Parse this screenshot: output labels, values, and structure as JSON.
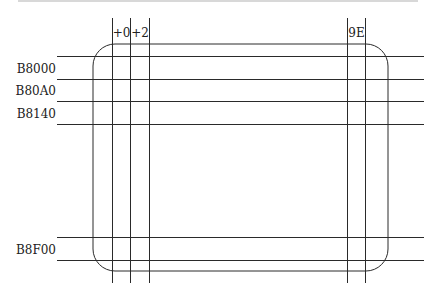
{
  "diagram": {
    "type": "memory-grid",
    "column_labels": [
      {
        "text": "+0",
        "x1": 112,
        "x2": 130
      },
      {
        "text": "+2",
        "x1": 130,
        "x2": 149
      },
      {
        "text": "9E",
        "x1": 347,
        "x2": 365
      }
    ],
    "row_labels": [
      {
        "text": "B8000",
        "y1": 56,
        "y2": 79
      },
      {
        "text": "B80A0",
        "y1": 79,
        "y2": 101
      },
      {
        "text": "B8140",
        "y1": 101,
        "y2": 124
      },
      {
        "text": "B8F00",
        "y1": 237,
        "y2": 260
      }
    ],
    "vertical_lines_x": [
      112,
      130,
      149,
      347,
      365
    ],
    "horizontal_lines_y": [
      56,
      79,
      101,
      124,
      237,
      260
    ],
    "screen_rect": {
      "x": 93,
      "y": 44,
      "width": 295,
      "height": 227,
      "radius": 22
    },
    "line_color": "#2a2a2a"
  }
}
